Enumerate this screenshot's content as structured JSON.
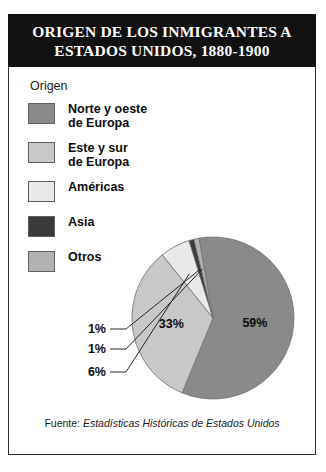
{
  "banner": {
    "title": "ORIGEN DE LOS INMIGRANTES A\nESTADOS UNIDOS, 1880-1900"
  },
  "legend": {
    "title": "Origen",
    "items": [
      {
        "label": "Norte y oeste\nde Europa",
        "color": "#8a8a8a"
      },
      {
        "label": "Este y sur\nde Europa",
        "color": "#c8c8c8"
      },
      {
        "label": "Américas",
        "color": "#e9e9e9"
      },
      {
        "label": "Asia",
        "color": "#3a3a3a"
      },
      {
        "label": "Otros",
        "color": "#b2b2b2"
      }
    ]
  },
  "footer": {
    "prefix": "Fuente: ",
    "source": "Estadísticas Históricas de Estados Unidos"
  },
  "chart_data": {
    "type": "pie",
    "title": "ORIGEN DE LOS INMIGRANTES A ESTADOS UNIDOS, 1880-1900",
    "legend_title": "Origen",
    "legend_position": "left",
    "unit": "%",
    "categories": [
      "Norte y oeste de Europa",
      "Este y sur de Europa",
      "Américas",
      "Asia",
      "Otros"
    ],
    "values": [
      59,
      33,
      6,
      1,
      1
    ],
    "labels": [
      "59%",
      "33%",
      "6%",
      "1%",
      "1%"
    ],
    "colors": [
      "#8a8a8a",
      "#c8c8c8",
      "#e9e9e9",
      "#3a3a3a",
      "#b2b2b2"
    ],
    "label_placement": [
      "inside",
      "inside",
      "callout",
      "callout",
      "callout"
    ],
    "source": "Estadísticas Históricas de Estados Unidos",
    "total": 100
  }
}
